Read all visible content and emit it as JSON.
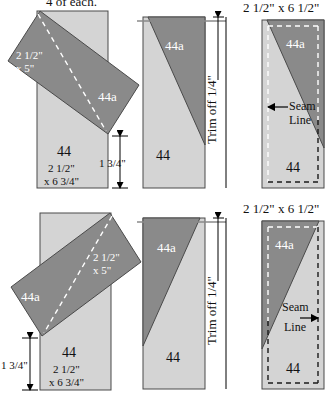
{
  "header": {
    "quantity_note": "4 of each."
  },
  "colors": {
    "dark_patch": "#8a8a8a",
    "light_patch": "#d4d4d4",
    "outline": "#4a4a4a",
    "dashed_guide": "#ffffff",
    "seam_dash": "#1a1a1a",
    "text": "#000000",
    "text_on_dark": "#ffffff",
    "background": "#ffffff"
  },
  "rows": [
    {
      "id": "row-top",
      "panels": {
        "placement": {
          "caption": null,
          "base_label": "44",
          "base_size_line1": "2 1/2\"",
          "base_size_line2": "x 6 3/4\"",
          "strip_label": "44a",
          "strip_size_line1": "2 1/2\"",
          "strip_size_line2": "x 5\"",
          "offset_dim": "1 3/4\"",
          "offset_dim_side": "right"
        },
        "sewn": {
          "dark_label": "44a",
          "light_label": "44",
          "trim_note": "Trim off 1/4\"",
          "diagonal_direction": "dark-upper-right"
        },
        "finished": {
          "caption": "2 1/2\" x 6 1/2\"",
          "dark_label": "44a",
          "light_label": "44",
          "seam_label_line1": "Seam",
          "seam_label_line2": "Line",
          "seam_arrow_direction": "left"
        }
      }
    },
    {
      "id": "row-bottom",
      "panels": {
        "placement": {
          "caption": null,
          "base_label": "44",
          "base_size_line1": "2 1/2\"",
          "base_size_line2": "x 6 3/4\"",
          "strip_label": "44a",
          "strip_size_line1": "2 1/2\"",
          "strip_size_line2": "x 5\"",
          "offset_dim": "1 3/4\"",
          "offset_dim_side": "left"
        },
        "sewn": {
          "dark_label": "44a",
          "light_label": "44",
          "trim_note": "Trim off 1/4\"",
          "diagonal_direction": "dark-upper-left"
        },
        "finished": {
          "caption": "2 1/2\" x 6 1/2\"",
          "dark_label": "44a",
          "light_label": "44",
          "seam_label_line1": "Seam",
          "seam_label_line2": "Line",
          "seam_arrow_direction": "right"
        }
      }
    }
  ]
}
